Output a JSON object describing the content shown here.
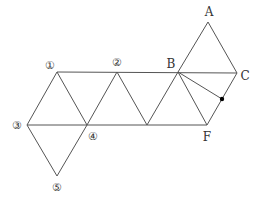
{
  "figure": {
    "type": "net-of-octahedron",
    "colors": {
      "line": "#555555",
      "text": "#333333",
      "dot": "#000000",
      "background": "#ffffff"
    },
    "vertices": {
      "A": [
        208,
        22
      ],
      "B": [
        178,
        72
      ],
      "C": [
        237,
        73
      ],
      "F": [
        207,
        125
      ],
      "n1": [
        57,
        72
      ],
      "n2": [
        117,
        72
      ],
      "n3": [
        27,
        125
      ],
      "n4": [
        87,
        125
      ],
      "m": [
        147,
        125
      ],
      "n5": [
        57,
        176
      ],
      "P": [
        222,
        99
      ]
    },
    "labels": [
      {
        "id": "label-A",
        "text": "A",
        "x": 209,
        "y": 12
      },
      {
        "id": "label-B",
        "text": "B",
        "x": 171,
        "y": 64
      },
      {
        "id": "label-C",
        "text": "C",
        "x": 245,
        "y": 76
      },
      {
        "id": "label-F",
        "text": "F",
        "x": 207,
        "y": 137
      },
      {
        "id": "label-1",
        "text": "①",
        "x": 50,
        "y": 65
      },
      {
        "id": "label-2",
        "text": "②",
        "x": 117,
        "y": 62
      },
      {
        "id": "label-3",
        "text": "③",
        "x": 17,
        "y": 125
      },
      {
        "id": "label-4",
        "text": "④",
        "x": 93,
        "y": 136
      },
      {
        "id": "label-5",
        "text": "⑤",
        "x": 57,
        "y": 187
      }
    ],
    "edges": [
      [
        "n1",
        "C"
      ],
      [
        "n3",
        "F"
      ],
      [
        "n1",
        "n3"
      ],
      [
        "n1",
        "n4"
      ],
      [
        "n2",
        "n4"
      ],
      [
        "n2",
        "m"
      ],
      [
        "B",
        "m"
      ],
      [
        "B",
        "F"
      ],
      [
        "C",
        "F"
      ],
      [
        "B",
        "A"
      ],
      [
        "A",
        "C"
      ],
      [
        "n3",
        "n5"
      ],
      [
        "n4",
        "n5"
      ],
      [
        "B",
        "P"
      ]
    ],
    "points": [
      {
        "id": "point-on-CF",
        "at": "P",
        "r": 2.2
      }
    ]
  }
}
